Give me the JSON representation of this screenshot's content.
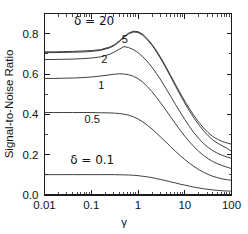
{
  "chart_data": {
    "type": "line",
    "title": "",
    "xlabel": "γ",
    "ylabel": "Signal-to-Noise Ratio",
    "xscale": "log",
    "yscale": "linear",
    "xlim": [
      0.01,
      100
    ],
    "ylim": [
      0.0,
      0.9
    ],
    "grid": false,
    "legend_position": "inline-annotations",
    "xticks": [
      0.01,
      0.1,
      1,
      10,
      100
    ],
    "xticklabels": [
      "0.01",
      "0.1",
      "1",
      "10",
      "100"
    ],
    "yticks": [
      0.0,
      0.2,
      0.4,
      0.6,
      0.8
    ],
    "yticklabels": [
      "0.0",
      "0.2",
      "0.4",
      "0.6",
      "0.8"
    ],
    "x": [
      0.01,
      0.0158,
      0.0251,
      0.0398,
      0.0631,
      0.1,
      0.158,
      0.251,
      0.316,
      0.398,
      0.501,
      0.631,
      0.794,
      1.0,
      1.26,
      1.58,
      2.0,
      2.51,
      3.16,
      3.98,
      5.01,
      6.31,
      7.94,
      10.0,
      12.6,
      15.8,
      20.0,
      25.1,
      31.6,
      39.8,
      50.1,
      63.1,
      79.4,
      100.0
    ],
    "series": [
      {
        "name": "δ = 20",
        "label": "δ = 20",
        "values": [
          0.71,
          0.71,
          0.711,
          0.712,
          0.714,
          0.716,
          0.721,
          0.734,
          0.746,
          0.764,
          0.785,
          0.803,
          0.812,
          0.81,
          0.797,
          0.775,
          0.747,
          0.714,
          0.676,
          0.635,
          0.592,
          0.549,
          0.507,
          0.466,
          0.428,
          0.393,
          0.361,
          0.333,
          0.309,
          0.29,
          0.276,
          0.266,
          0.258,
          0.252
        ]
      },
      {
        "name": "δ = 5",
        "label": "5",
        "values": [
          0.706,
          0.706,
          0.707,
          0.708,
          0.709,
          0.712,
          0.717,
          0.73,
          0.742,
          0.76,
          0.781,
          0.799,
          0.808,
          0.806,
          0.792,
          0.77,
          0.742,
          0.708,
          0.67,
          0.629,
          0.585,
          0.541,
          0.498,
          0.456,
          0.417,
          0.381,
          0.348,
          0.319,
          0.294,
          0.273,
          0.257,
          0.244,
          0.232,
          0.216
        ]
      },
      {
        "name": "δ = 2",
        "label": "2",
        "values": [
          0.672,
          0.672,
          0.673,
          0.674,
          0.676,
          0.679,
          0.685,
          0.698,
          0.71,
          0.723,
          0.736,
          0.731,
          0.721,
          0.706,
          0.686,
          0.662,
          0.633,
          0.601,
          0.566,
          0.528,
          0.489,
          0.45,
          0.412,
          0.375,
          0.34,
          0.308,
          0.28,
          0.256,
          0.236,
          0.22,
          0.207,
          0.197,
          0.189,
          0.182
        ]
      },
      {
        "name": "δ = 1",
        "label": "1",
        "values": [
          0.578,
          0.578,
          0.579,
          0.58,
          0.582,
          0.585,
          0.59,
          0.596,
          0.599,
          0.601,
          0.6,
          0.596,
          0.589,
          0.577,
          0.56,
          0.538,
          0.512,
          0.483,
          0.452,
          0.42,
          0.387,
          0.354,
          0.322,
          0.292,
          0.264,
          0.239,
          0.216,
          0.197,
          0.18,
          0.166,
          0.155,
          0.146,
          0.138,
          0.131
        ]
      },
      {
        "name": "δ = 0.5",
        "label": "0.5",
        "values": [
          0.409,
          0.409,
          0.409,
          0.409,
          0.409,
          0.409,
          0.408,
          0.407,
          0.406,
          0.404,
          0.401,
          0.396,
          0.388,
          0.377,
          0.363,
          0.346,
          0.327,
          0.306,
          0.284,
          0.262,
          0.239,
          0.217,
          0.196,
          0.176,
          0.158,
          0.141,
          0.126,
          0.113,
          0.102,
          0.093,
          0.086,
          0.08,
          0.076,
          0.073
        ]
      },
      {
        "name": "δ = 0.1",
        "label": "δ = 0.1",
        "values": [
          0.101,
          0.101,
          0.101,
          0.101,
          0.101,
          0.101,
          0.101,
          0.101,
          0.101,
          0.1,
          0.1,
          0.099,
          0.098,
          0.096,
          0.093,
          0.09,
          0.086,
          0.081,
          0.076,
          0.071,
          0.065,
          0.06,
          0.054,
          0.049,
          0.044,
          0.039,
          0.035,
          0.031,
          0.028,
          0.025,
          0.023,
          0.021,
          0.02,
          0.019
        ]
      }
    ],
    "annotations": [
      {
        "text": "δ = 20",
        "x": 0.115,
        "y": 0.845
      },
      {
        "text": "5",
        "x": 0.52,
        "y": 0.755
      },
      {
        "text": "2",
        "x": 0.19,
        "y": 0.655
      },
      {
        "text": "1",
        "x": 0.165,
        "y": 0.525
      },
      {
        "text": "0.5",
        "x": 0.105,
        "y": 0.355
      },
      {
        "text": "δ = 0.1",
        "x": 0.105,
        "y": 0.155
      }
    ]
  },
  "figure": {
    "ylabel_text": "Signal-to-Noise Ratio",
    "xlabel_text": "γ"
  }
}
